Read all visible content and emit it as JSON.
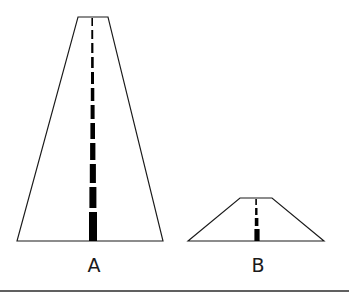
{
  "figure": {
    "background_color": "#ffffff",
    "line_color": "#1a1a1a",
    "dash_color": "#000000",
    "rule_color": "#2b2b2b",
    "shapes": [
      {
        "id": "road-a",
        "label": "A",
        "label_x": 94,
        "label_y": 272,
        "outline_points": "78,17 108,17 163,241 17,241",
        "top_left_x": 78,
        "top_right_x": 108,
        "top_y": 17,
        "bottom_left_x": 17,
        "bottom_right_x": 163,
        "bottom_y": 241,
        "dashes": [
          {
            "x": 91.4,
            "y": 18,
            "w": 1.6,
            "h": 8
          },
          {
            "x": 91.3,
            "y": 30,
            "w": 1.9,
            "h": 9
          },
          {
            "x": 91.2,
            "y": 43,
            "w": 2.2,
            "h": 10
          },
          {
            "x": 91.1,
            "y": 57,
            "w": 2.6,
            "h": 11
          },
          {
            "x": 91.0,
            "y": 72,
            "w": 3.0,
            "h": 12
          },
          {
            "x": 90.8,
            "y": 88,
            "w": 3.5,
            "h": 13
          },
          {
            "x": 90.6,
            "y": 105,
            "w": 4.0,
            "h": 14
          },
          {
            "x": 90.4,
            "y": 123,
            "w": 4.6,
            "h": 16
          },
          {
            "x": 90.1,
            "y": 143,
            "w": 5.3,
            "h": 17
          },
          {
            "x": 89.8,
            "y": 164,
            "w": 6.1,
            "h": 19
          },
          {
            "x": 89.4,
            "y": 187,
            "w": 7.0,
            "h": 21
          },
          {
            "x": 89.0,
            "y": 212,
            "w": 8.0,
            "h": 29
          }
        ]
      },
      {
        "id": "road-b",
        "label": "B",
        "label_x": 258,
        "label_y": 272,
        "outline_points": "240,198 272,198 324,241 188,241",
        "top_left_x": 240,
        "top_right_x": 272,
        "top_y": 198,
        "bottom_left_x": 188,
        "bottom_right_x": 324,
        "bottom_y": 241,
        "dashes": [
          {
            "x": 255.3,
            "y": 199,
            "w": 1.6,
            "h": 6
          },
          {
            "x": 255.1,
            "y": 208,
            "w": 2.4,
            "h": 7
          },
          {
            "x": 254.8,
            "y": 218,
            "w": 3.6,
            "h": 8
          },
          {
            "x": 254.4,
            "y": 229,
            "w": 5.2,
            "h": 12
          }
        ]
      }
    ],
    "bottom_rule": {
      "x1": 0,
      "y1": 291,
      "x2": 349,
      "y2": 291
    }
  }
}
